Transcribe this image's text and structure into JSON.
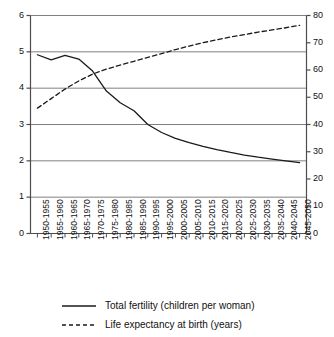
{
  "chart_data": {
    "type": "line",
    "title": "",
    "subtitle": "",
    "xlabel": "",
    "ylabel": "Total fertility (children per woman)",
    "y2label": "Life expectancy at birth (years)",
    "grid": true,
    "legend_position": "bottom",
    "ylim": [
      0,
      6
    ],
    "y2lim": [
      0,
      80
    ],
    "yticks": [
      0,
      1,
      2,
      3,
      4,
      5,
      6
    ],
    "y2ticks": [
      0,
      10,
      20,
      30,
      40,
      50,
      60,
      70,
      80
    ],
    "categories": [
      "1950-1955",
      "1955-1960",
      "1960-1965",
      "1965-1970",
      "1970-1975",
      "1975-1980",
      "1980-1985",
      "1985-1990",
      "1990-1995",
      "1995-2000",
      "2000-2005",
      "2005-2010",
      "2010-2015",
      "2015-2020",
      "2020-2025",
      "2025-2030",
      "2030-2035",
      "2035-2040",
      "2040-2045",
      "2045-2050"
    ],
    "series": [
      {
        "name": "Total fertility (children per woman)",
        "axis": "left",
        "style": "solid",
        "color": "#1a1a1a",
        "values": [
          4.92,
          4.78,
          4.9,
          4.8,
          4.47,
          3.92,
          3.6,
          3.38,
          3.0,
          2.78,
          2.62,
          2.5,
          2.4,
          2.31,
          2.23,
          2.16,
          2.1,
          2.05,
          2.0,
          1.95
        ]
      },
      {
        "name": "Life expectancy at birth (years)",
        "axis": "right",
        "style": "dashed",
        "color": "#1a1a1a",
        "values": [
          46.0,
          49.5,
          53.0,
          56.0,
          58.5,
          60.3,
          61.8,
          63.2,
          64.6,
          66.0,
          67.5,
          68.8,
          70.0,
          71.1,
          72.1,
          73.0,
          73.9,
          74.7,
          75.5,
          76.4
        ]
      }
    ]
  },
  "legend": {
    "items": [
      {
        "label": "Total fertility (children per woman)",
        "style": "solid"
      },
      {
        "label": "Life expectancy at birth (years)",
        "style": "dashed"
      }
    ]
  }
}
